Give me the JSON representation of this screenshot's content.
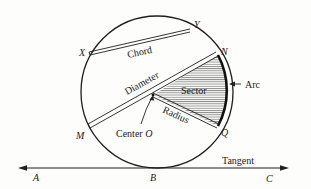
{
  "diagram": {
    "points": {
      "X": "X",
      "Y": "Y",
      "N": "N",
      "M": "M",
      "Q": "Q",
      "A": "A",
      "B": "B",
      "C": "C"
    },
    "labels": {
      "chord": "Chord",
      "diameter": "Diameter",
      "sector": "Sector",
      "radius": "Radius",
      "arc": "Arc",
      "center_prefix": "Center ",
      "center_point": "O",
      "tangent": "Tangent"
    },
    "colors": {
      "ink": "#1f1f1f",
      "background": "#fdfdfb"
    }
  }
}
